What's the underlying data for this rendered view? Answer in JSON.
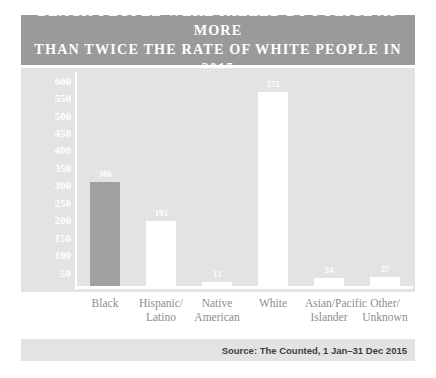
{
  "title": "Black people were killed by police at more\nthan twice the rate of white people in 2015",
  "source": "Source: The Counted, 1 Jan–31 Dec 2015",
  "colors": {
    "banner_background": "#9a9a9a",
    "plot_background": "#e3e3e3",
    "accent_bar": "#a0a0a0",
    "default_bar": "#ffffff",
    "title_text": "#ffffff",
    "axis_tick_text": "#ffffff",
    "category_text": "#8d8d8d",
    "source_text": "#3d3d3d",
    "axis_line": "#ffffff"
  },
  "chart_data": {
    "type": "bar",
    "title": "Black people were killed by police at more than twice the rate of white people in 2015",
    "xlabel": "",
    "ylabel": "",
    "ylim": [
      0,
      625
    ],
    "grid": false,
    "legend": "none",
    "yticks": [
      600,
      550,
      500,
      450,
      400,
      350,
      300,
      250,
      200,
      150,
      100,
      50
    ],
    "categories": [
      "Black",
      "Hispanic/\nLatino",
      "Native\nAmerican",
      "White",
      "Asian/Pacific\nIslander",
      "Other/\nUnknown"
    ],
    "values": [
      306,
      193,
      13,
      572,
      24,
      27
    ],
    "bar_colors": [
      "#a0a0a0",
      "#ffffff",
      "#ffffff",
      "#ffffff",
      "#ffffff",
      "#ffffff"
    ],
    "data_labels": [
      "306",
      "193",
      "13",
      "572",
      "24",
      "27"
    ]
  }
}
